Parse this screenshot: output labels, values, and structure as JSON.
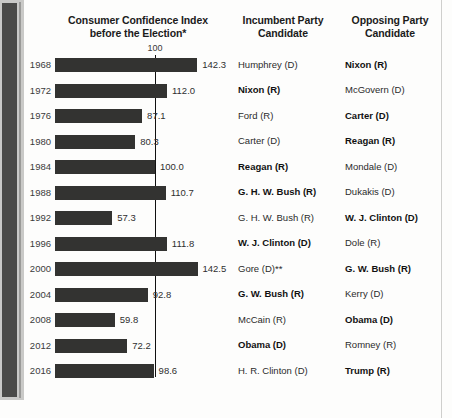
{
  "headers": {
    "chart_title_line1": "Consumer Confidence Index",
    "chart_title_line2": "before the Election*",
    "incumbent_line1": "Incumbent Party",
    "incumbent_line2": "Candidate",
    "opposing_line1": "Opposing Party",
    "opposing_line2": "Candidate"
  },
  "reference_label": "100",
  "colors": {
    "bar": "#333331",
    "reference_line": "#101010",
    "text": "#2b2b2b"
  },
  "chart_data": {
    "type": "bar",
    "orientation": "horizontal",
    "title": "Consumer Confidence Index before the Election*",
    "xlabel": "",
    "ylabel": "",
    "categories": [
      "1968",
      "1972",
      "1976",
      "1980",
      "1984",
      "1988",
      "1992",
      "1996",
      "2000",
      "2004",
      "2008",
      "2012",
      "2016"
    ],
    "values": [
      142.3,
      112.0,
      87.1,
      80.3,
      100.0,
      110.7,
      57.3,
      111.8,
      142.5,
      92.8,
      59.8,
      72.2,
      98.6
    ],
    "value_labels": [
      "142.3",
      "112.0",
      "87.1",
      "80.3",
      "100.0",
      "110.7",
      "57.3",
      "111.8",
      "142.5",
      "92.8",
      "59.8",
      "72.2",
      "98.6"
    ],
    "reference_line": 100,
    "reference_line_label": "100",
    "xlim": [
      0,
      150
    ],
    "grid": false,
    "legend": false
  },
  "rows": [
    {
      "year": "1968",
      "value": 142.3,
      "value_label": "142.3",
      "incumbent": "Humphrey (D)",
      "incumbent_won": false,
      "opposing": "Nixon (R)",
      "opposing_won": true
    },
    {
      "year": "1972",
      "value": 112.0,
      "value_label": "112.0",
      "incumbent": "Nixon (R)",
      "incumbent_won": true,
      "opposing": "McGovern (D)",
      "opposing_won": false
    },
    {
      "year": "1976",
      "value": 87.1,
      "value_label": "87.1",
      "incumbent": "Ford (R)",
      "incumbent_won": false,
      "opposing": "Carter (D)",
      "opposing_won": true
    },
    {
      "year": "1980",
      "value": 80.3,
      "value_label": "80.3",
      "incumbent": "Carter (D)",
      "incumbent_won": false,
      "opposing": "Reagan (R)",
      "opposing_won": true
    },
    {
      "year": "1984",
      "value": 100.0,
      "value_label": "100.0",
      "incumbent": "Reagan (R)",
      "incumbent_won": true,
      "opposing": "Mondale (D)",
      "opposing_won": false
    },
    {
      "year": "1988",
      "value": 110.7,
      "value_label": "110.7",
      "incumbent": "G. H. W. Bush (R)",
      "incumbent_won": true,
      "opposing": "Dukakis (D)",
      "opposing_won": false
    },
    {
      "year": "1992",
      "value": 57.3,
      "value_label": "57.3",
      "incumbent": "G. H. W. Bush (R)",
      "incumbent_won": false,
      "opposing": "W. J. Clinton (D)",
      "opposing_won": true
    },
    {
      "year": "1996",
      "value": 111.8,
      "value_label": "111.8",
      "incumbent": "W. J. Clinton (D)",
      "incumbent_won": true,
      "opposing": "Dole (R)",
      "opposing_won": false
    },
    {
      "year": "2000",
      "value": 142.5,
      "value_label": "142.5",
      "incumbent": "Gore (D)**",
      "incumbent_won": false,
      "opposing": "G. W. Bush (R)",
      "opposing_won": true
    },
    {
      "year": "2004",
      "value": 92.8,
      "value_label": "92.8",
      "incumbent": "G. W. Bush (R)",
      "incumbent_won": true,
      "opposing": "Kerry (D)",
      "opposing_won": false
    },
    {
      "year": "2008",
      "value": 59.8,
      "value_label": "59.8",
      "incumbent": "McCain (R)",
      "incumbent_won": false,
      "opposing": "Obama (D)",
      "opposing_won": true
    },
    {
      "year": "2012",
      "value": 72.2,
      "value_label": "72.2",
      "incumbent": "Obama (D)",
      "incumbent_won": true,
      "opposing": "Romney (R)",
      "opposing_won": false
    },
    {
      "year": "2016",
      "value": 98.6,
      "value_label": "98.6",
      "incumbent": "H. R. Clinton (D)",
      "incumbent_won": false,
      "opposing": "Trump (R)",
      "opposing_won": true
    }
  ]
}
